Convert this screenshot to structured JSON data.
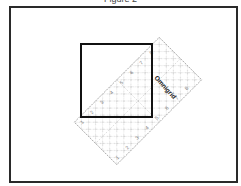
{
  "caption": {
    "text": "Figure 2",
    "clipped": true
  },
  "diagram": {
    "frame": {
      "x": 10,
      "y": 7,
      "width": 226,
      "height": 174,
      "stroke": "#2a2a2a"
    },
    "square": {
      "x": 81,
      "y": 44,
      "width": 71,
      "height": 73,
      "stroke": "#111111",
      "stroke_width": 2
    },
    "ruler": {
      "label": "Omnigrid",
      "corners": {
        "top": [
          159,
          38
        ],
        "right": [
          200,
          80
        ],
        "bottom": [
          117,
          165
        ],
        "left": [
          76,
          123
        ]
      },
      "center": [
        138,
        101
      ],
      "rotation_deg": -45,
      "grid_color": "#9a9a9a",
      "numbers_visible": [
        "1",
        "2",
        "3",
        "4",
        "5",
        "6",
        "7",
        "8"
      ]
    }
  }
}
